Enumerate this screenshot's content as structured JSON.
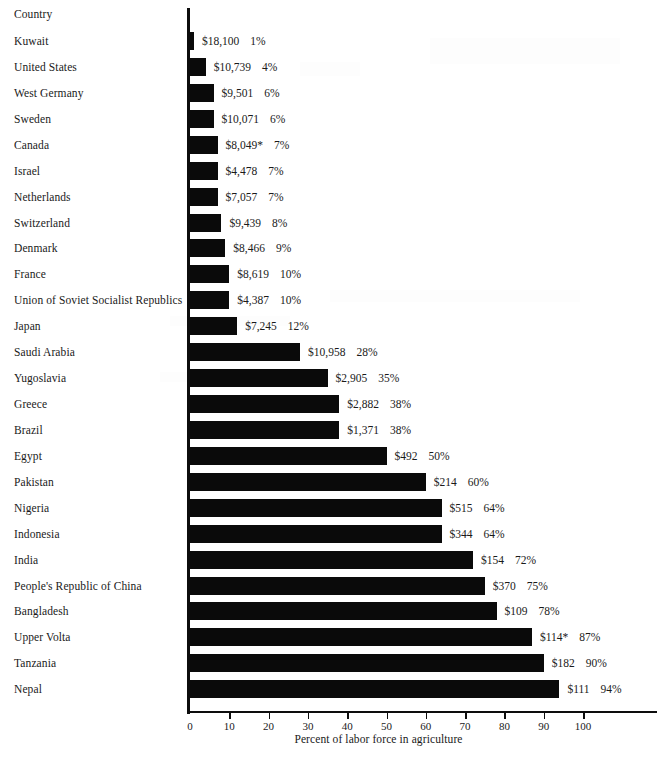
{
  "header": {
    "country_column_label": "Country"
  },
  "axis": {
    "caption": "Percent of labor force in agriculture",
    "tick_labels": [
      "0",
      "10",
      "20",
      "30",
      "40",
      "50",
      "60",
      "70",
      "80",
      "90",
      "100"
    ],
    "ticks": [
      0,
      10,
      20,
      30,
      40,
      50,
      60,
      70,
      80,
      90,
      100
    ]
  },
  "chart_data": {
    "type": "bar",
    "orientation": "horizontal",
    "title": "",
    "xlabel": "Percent of labor force in agriculture",
    "ylabel": "Country",
    "xlim": [
      0,
      120
    ],
    "grid": false,
    "legend": null,
    "categories": [
      "Kuwait",
      "United States",
      "West Germany",
      "Sweden",
      "Canada",
      "Israel",
      "Netherlands",
      "Switzerland",
      "Denmark",
      "France",
      "Union of Soviet Socialist Republics",
      "Japan",
      "Saudi Arabia",
      "Yugoslavia",
      "Greece",
      "Brazil",
      "Egypt",
      "Pakistan",
      "Nigeria",
      "Indonesia",
      "India",
      "People's Republic of China",
      "Bangladesh",
      "Upper Volta",
      "Tanzania",
      "Nepal"
    ],
    "values": [
      1,
      4,
      6,
      6,
      7,
      7,
      7,
      8,
      9,
      10,
      10,
      12,
      28,
      35,
      38,
      38,
      50,
      60,
      64,
      64,
      72,
      75,
      78,
      87,
      90,
      94
    ],
    "rows": [
      {
        "country": "Kuwait",
        "gnp": "$18,100",
        "percent": 1,
        "percent_label": "1%"
      },
      {
        "country": "United States",
        "gnp": "$10,739",
        "percent": 4,
        "percent_label": "4%"
      },
      {
        "country": "West Germany",
        "gnp": "$9,501",
        "percent": 6,
        "percent_label": "6%"
      },
      {
        "country": "Sweden",
        "gnp": "$10,071",
        "percent": 6,
        "percent_label": "6%"
      },
      {
        "country": "Canada",
        "gnp": "$8,049*",
        "percent": 7,
        "percent_label": "7%"
      },
      {
        "country": "Israel",
        "gnp": "$4,478",
        "percent": 7,
        "percent_label": "7%"
      },
      {
        "country": "Netherlands",
        "gnp": "$7,057",
        "percent": 7,
        "percent_label": "7%"
      },
      {
        "country": "Switzerland",
        "gnp": "$9,439",
        "percent": 8,
        "percent_label": "8%"
      },
      {
        "country": "Denmark",
        "gnp": "$8,466",
        "percent": 9,
        "percent_label": "9%"
      },
      {
        "country": "France",
        "gnp": "$8,619",
        "percent": 10,
        "percent_label": "10%"
      },
      {
        "country": "Union of Soviet Socialist Republics",
        "gnp": "$4,387",
        "percent": 10,
        "percent_label": "10%"
      },
      {
        "country": "Japan",
        "gnp": "$7,245",
        "percent": 12,
        "percent_label": "12%"
      },
      {
        "country": "Saudi Arabia",
        "gnp": "$10,958",
        "percent": 28,
        "percent_label": "28%"
      },
      {
        "country": "Yugoslavia",
        "gnp": "$2,905",
        "percent": 35,
        "percent_label": "35%"
      },
      {
        "country": "Greece",
        "gnp": "$2,882",
        "percent": 38,
        "percent_label": "38%"
      },
      {
        "country": "Brazil",
        "gnp": "$1,371",
        "percent": 38,
        "percent_label": "38%"
      },
      {
        "country": "Egypt",
        "gnp": "$492",
        "percent": 50,
        "percent_label": "50%"
      },
      {
        "country": "Pakistan",
        "gnp": "$214",
        "percent": 60,
        "percent_label": "60%"
      },
      {
        "country": "Nigeria",
        "gnp": "$515",
        "percent": 64,
        "percent_label": "64%"
      },
      {
        "country": "Indonesia",
        "gnp": "$344",
        "percent": 64,
        "percent_label": "64%"
      },
      {
        "country": "India",
        "gnp": "$154",
        "percent": 72,
        "percent_label": "72%"
      },
      {
        "country": "People's Republic of China",
        "gnp": "$370",
        "percent": 75,
        "percent_label": "75%"
      },
      {
        "country": "Bangladesh",
        "gnp": "$109",
        "percent": 78,
        "percent_label": "78%"
      },
      {
        "country": "Upper Volta",
        "gnp": "$114*",
        "percent": 87,
        "percent_label": "87%"
      },
      {
        "country": "Tanzania",
        "gnp": "$182",
        "percent": 90,
        "percent_label": "90%"
      },
      {
        "country": "Nepal",
        "gnp": "$111",
        "percent": 94,
        "percent_label": "94%"
      }
    ]
  },
  "style": {
    "bar_color": "#0a0a0a",
    "axis_color": "#0d0d0d",
    "text_color": "#1a1a1a",
    "background": "#ffffff"
  }
}
